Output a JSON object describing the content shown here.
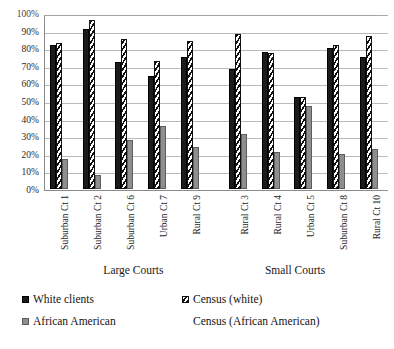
{
  "title_strip": "cut-off heading text",
  "chart_data": {
    "type": "bar",
    "title": "",
    "xlabel": "",
    "ylabel": "",
    "ylim": [
      0,
      100
    ],
    "ytick_labels": [
      "100%",
      "90%",
      "80%",
      "70%",
      "60%",
      "50%",
      "40%",
      "30%",
      "20%",
      "10%",
      "0%"
    ],
    "ytick_values": [
      100,
      90,
      80,
      70,
      60,
      50,
      40,
      30,
      20,
      10,
      0
    ],
    "grid": true,
    "legend_position": "bottom",
    "categories": [
      "Suburban Ct 1",
      "Suburban Ct 2",
      "Suburban Ct 6",
      "Urban Ct 7",
      "Rural Ct 9",
      "Rural Ct 3",
      "Rural Ct 4",
      "Urban Ct 5",
      "Suburban Ct 8",
      "Rural Ct 10"
    ],
    "series": [
      {
        "name": "White clients",
        "key": "white-clients",
        "values": [
          82,
          91,
          72,
          64,
          75,
          68,
          78,
          52,
          80,
          75
        ]
      },
      {
        "name": "Census (white)",
        "key": "census-white",
        "values": [
          83,
          96,
          85,
          73,
          84,
          88,
          77,
          52,
          82,
          87
        ]
      },
      {
        "name": "African American",
        "key": "african-american",
        "values": [
          17,
          8,
          28,
          36,
          24,
          31,
          21,
          47,
          20,
          23
        ]
      },
      {
        "name": "Census (African American)",
        "key": "census-african-american",
        "values": [
          16,
          3,
          12,
          30,
          12,
          10,
          22,
          49,
          16,
          11
        ]
      }
    ],
    "group_captions": [
      {
        "label": "Large Courts",
        "categories": [
          "Suburban Ct 1",
          "Suburban Ct 2",
          "Suburban Ct 6",
          "Urban Ct 7",
          "Rural Ct 9"
        ]
      },
      {
        "label": "Small Courts",
        "categories": [
          "Rural Ct 3",
          "Rural Ct 4",
          "Urban Ct 5",
          "Suburban Ct 8",
          "Rural Ct 10"
        ]
      }
    ]
  },
  "legend": {
    "items": [
      {
        "label": "White clients",
        "key": "white-clients"
      },
      {
        "label": "Census (white)",
        "key": "census-white"
      },
      {
        "label": "African American",
        "key": "african-american"
      },
      {
        "label": "Census (African American)",
        "key": "census-african-american"
      }
    ]
  }
}
